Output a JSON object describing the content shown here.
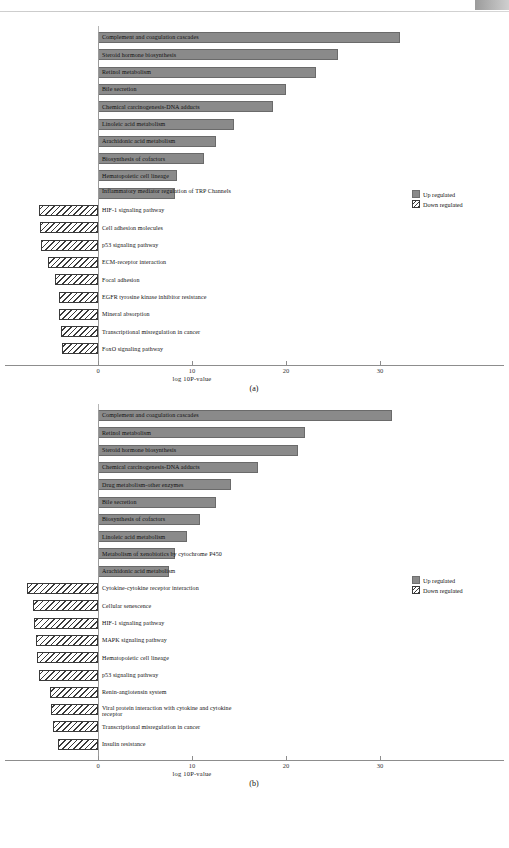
{
  "page": {
    "header_faint": "",
    "figure_a_caption": "(a)",
    "figure_b_caption": "(b)"
  },
  "legend": {
    "up_label": "Up regulated",
    "down_label": "Down regulated",
    "up_color": "#8a8a8a",
    "down_color": "#ffffff"
  },
  "axis": {
    "title": "log 10P-value",
    "ticks": [
      "0",
      "10",
      "20",
      "30"
    ],
    "tick_values": [
      0,
      10,
      20,
      30
    ]
  },
  "chart_data": [
    {
      "type": "bar",
      "title": "(a)",
      "orientation": "horizontal",
      "xlabel": "log 10P-value",
      "ylabel": "",
      "xlim": [
        -8,
        34
      ],
      "grid": false,
      "legend_position": "right",
      "series": [
        {
          "name": "Up regulated",
          "fill": "solid"
        },
        {
          "name": "Down regulated",
          "fill": "hatched"
        }
      ],
      "categories": [
        "Complement and coagulation cascades",
        "Steroid hormone biosynthesis",
        "Retinol metabolism",
        "Bile secretion",
        "Chemical carcinogenesis-DNA adducts",
        "Linoleic acid metabolism",
        "Arachidonic acid metabolism",
        "Biosynthesis of cofactors",
        "Hematopoietic cell lineage",
        "Inflammatory mediator regulation of TRP Channels",
        "HIF-1 signaling pathway",
        "Cell adhesion molecules",
        "p53 signaling pathway",
        "ECM-receptor interaction",
        "Focal adhesion",
        "EGFR tyrosine kinase inhibitor resistance",
        "Mineral absorption",
        "Transcriptional misregulation in cancer",
        "FoxO signaling pathway"
      ],
      "values": [
        32.1,
        25.5,
        23.2,
        20.0,
        18.6,
        14.5,
        12.6,
        11.3,
        8.4,
        8.2,
        -6.3,
        -6.2,
        -6.1,
        -5.3,
        -4.6,
        -4.2,
        -4.1,
        -3.9,
        -3.8
      ],
      "regulation": [
        "up",
        "up",
        "up",
        "up",
        "up",
        "up",
        "up",
        "up",
        "up",
        "up",
        "down",
        "down",
        "down",
        "down",
        "down",
        "down",
        "down",
        "down",
        "down"
      ]
    },
    {
      "type": "bar",
      "title": "(b)",
      "orientation": "horizontal",
      "xlabel": "log 10P-value",
      "ylabel": "",
      "xlim": [
        -8,
        34
      ],
      "grid": false,
      "legend_position": "right",
      "series": [
        {
          "name": "Up regulated",
          "fill": "solid"
        },
        {
          "name": "Down regulated",
          "fill": "hatched"
        }
      ],
      "categories": [
        "Complement and coagulation cascades",
        "Retinol metabolism",
        "Steroid hormone biosynthesis",
        "Chemical carcinogenesis-DNA adducts",
        "Drug metabolism-other enzymes",
        "Bile secretion",
        "Biosynthesis of cofactors",
        "Linoleic acid metabolism",
        "Metabolism of xenobiotics by cytochrome P450",
        "Arachidonic acid metabolism",
        "Cytokine-cytokine receptor interaction",
        "Cellular senescence",
        "HIF-1 signaling pathway",
        "MAPK signaling pathway",
        "Hematopoietic cell lineage",
        "p53 signaling pathway",
        "Renin-angiotensin system",
        "Viral protein interaction with cytokine and cytokine receptor",
        "Transcriptional misregulation in cancer",
        "Insulin resistance"
      ],
      "values": [
        31.3,
        22.0,
        21.3,
        17.0,
        14.2,
        12.5,
        10.8,
        9.5,
        8.2,
        7.6,
        -7.6,
        -6.9,
        -6.8,
        -6.6,
        -6.5,
        -6.3,
        -5.1,
        -5.0,
        -4.8,
        -4.3
      ],
      "regulation": [
        "up",
        "up",
        "up",
        "up",
        "up",
        "up",
        "up",
        "up",
        "up",
        "up",
        "down",
        "down",
        "down",
        "down",
        "down",
        "down",
        "down",
        "down",
        "down",
        "down"
      ]
    }
  ]
}
